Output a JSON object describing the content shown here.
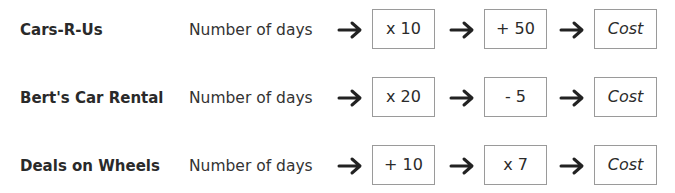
{
  "rows": [
    {
      "company": "Cars-R-Us",
      "input": "Number of days",
      "step1": "x 10",
      "step2": "+ 50",
      "output": "Cost"
    },
    {
      "company": "Bert's Car Rental",
      "input": "Number of days",
      "step1": "x 20",
      "step2": "- 5",
      "output": "Cost"
    },
    {
      "company": "Deals on Wheels",
      "input": "Number of days",
      "step1": "+ 10",
      "step2": "x 7",
      "output": "Cost"
    }
  ],
  "icons": {
    "arrow": "right-arrow-icon"
  },
  "colors": {
    "text": "#2a2a2a",
    "box_border": "#9a9a9a",
    "arrow": "#222222",
    "background": "#ffffff"
  }
}
